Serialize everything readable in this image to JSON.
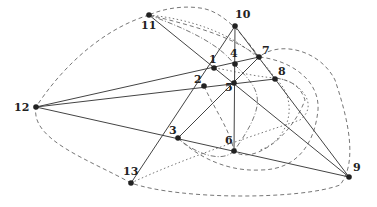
{
  "diagram": {
    "type": "graph",
    "nodes": [
      {
        "id": "1",
        "label": "1"
      },
      {
        "id": "2",
        "label": "2"
      },
      {
        "id": "3",
        "label": "3"
      },
      {
        "id": "4",
        "label": "4"
      },
      {
        "id": "5",
        "label": "5"
      },
      {
        "id": "6",
        "label": "6"
      },
      {
        "id": "7",
        "label": "7"
      },
      {
        "id": "8",
        "label": "8"
      },
      {
        "id": "9",
        "label": "9"
      },
      {
        "id": "10",
        "label": "10"
      },
      {
        "id": "11",
        "label": "11"
      },
      {
        "id": "12",
        "label": "12"
      },
      {
        "id": "13",
        "label": "13"
      }
    ],
    "solid_lines": [
      [
        "12",
        "7"
      ],
      [
        "12",
        "8"
      ],
      [
        "12",
        "9"
      ],
      [
        "11",
        "9"
      ],
      [
        "10",
        "9"
      ],
      [
        "10",
        "6"
      ],
      [
        "10",
        "13"
      ],
      [
        "3",
        "7"
      ]
    ],
    "colors": {
      "line": "#444444",
      "node": "#222222",
      "curve": "#666666"
    }
  }
}
